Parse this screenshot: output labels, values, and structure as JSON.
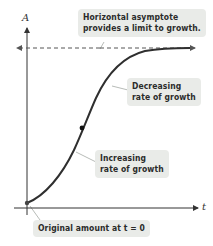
{
  "diagram": {
    "type": "logistic-growth-curve",
    "axes": {
      "y_label": "A",
      "x_label": "t"
    },
    "annotations": {
      "asymptote_line1": "Horizontal asymptote",
      "asymptote_line2": "provides a limit to growth.",
      "decreasing_line1": "Decreasing",
      "decreasing_line2": "rate of growth",
      "increasing_line1": "Increasing",
      "increasing_line2": "rate of growth",
      "original": "Original amount at t = 0"
    },
    "colors": {
      "curve": "#2f2f2f",
      "axes": "#333333",
      "asymptote": "#666666",
      "callout_bg": "#e9ebe8"
    }
  }
}
